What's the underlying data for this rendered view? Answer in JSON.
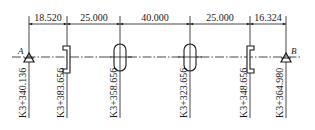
{
  "diagram": {
    "type": "stationing / chainage layout",
    "points": {
      "start": {
        "label": "A",
        "station": "K3+340.136",
        "x": 29
      },
      "end": {
        "label": "B",
        "station": "K3+364.980",
        "x": 286
      }
    },
    "stations": [
      {
        "id": "A",
        "label": "K3+340.136",
        "x": 29,
        "symbol": "triangle"
      },
      {
        "id": "s1",
        "label": "K3+383.656",
        "x": 67,
        "symbol": "bracket-left"
      },
      {
        "id": "s2",
        "label": "K3+358.656",
        "x": 120,
        "symbol": "slot"
      },
      {
        "id": "s3",
        "label": "K3+323.656",
        "x": 190,
        "symbol": "slot"
      },
      {
        "id": "s4",
        "label": "K3+348.656",
        "x": 250,
        "symbol": "bracket-right"
      },
      {
        "id": "B",
        "label": "K3+364.980",
        "x": 286,
        "symbol": "triangle"
      }
    ],
    "dimensions": [
      {
        "label": "18.520",
        "from": 29,
        "to": 67
      },
      {
        "label": "25.000",
        "from": 67,
        "to": 120
      },
      {
        "label": "40.000",
        "from": 120,
        "to": 190
      },
      {
        "label": "25.000",
        "from": 190,
        "to": 250
      },
      {
        "label": "16.324",
        "from": 250,
        "to": 286
      }
    ],
    "colors": {
      "line": "#1a1a1a",
      "background": "#ffffff"
    }
  }
}
